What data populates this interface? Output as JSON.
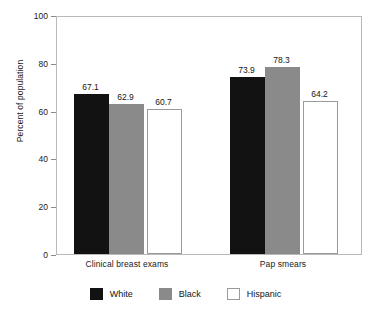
{
  "chart_data": {
    "type": "bar",
    "title": "",
    "xlabel": "",
    "ylabel": "Percent of population",
    "ylim": [
      0,
      100
    ],
    "ytick_labels": [
      "0",
      "20",
      "40",
      "60",
      "80",
      "100"
    ],
    "ytick_values": [
      0,
      20,
      40,
      60,
      80,
      100
    ],
    "grid": false,
    "legend_position": "bottom",
    "categories": [
      "Clinical breast exams",
      "Pap smears"
    ],
    "series": [
      {
        "name": "White",
        "color": "#121212",
        "values": [
          67.1,
          73.9
        ],
        "labels": [
          "67.1",
          "73.9"
        ]
      },
      {
        "name": "Black",
        "color": "#8a8a8a",
        "values": [
          62.9,
          78.3
        ],
        "labels": [
          "62.9",
          "78.3"
        ]
      },
      {
        "name": "Hispanic",
        "color": "#ffffff",
        "values": [
          60.7,
          64.2
        ],
        "labels": [
          "60.7",
          "64.2"
        ]
      }
    ]
  },
  "axes": {
    "y_title": "Percent of population"
  },
  "legend": {
    "items": [
      {
        "label": "White"
      },
      {
        "label": "Black"
      },
      {
        "label": "Hispanic"
      }
    ]
  }
}
